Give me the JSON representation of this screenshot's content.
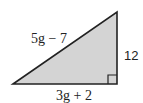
{
  "diagram": {
    "type": "right-triangle",
    "labels": {
      "hypotenuse": "5g − 7",
      "vertical_leg": "12",
      "horizontal_leg": "3g + 2"
    },
    "right_angle_marker": true,
    "colors": {
      "fill": "#d4d4d4",
      "stroke": "#222222"
    }
  }
}
